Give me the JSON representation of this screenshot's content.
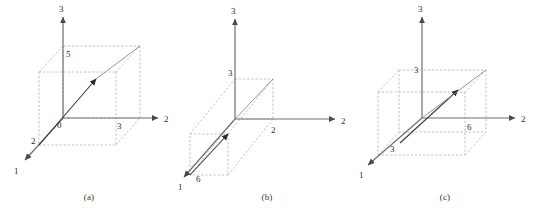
{
  "figure": {
    "background_color": "#ffffff",
    "axis_color": "#6e6e6e",
    "dashed_color": "#b9b9b9",
    "vector_color": "#4a4a4a",
    "label_color": "#2b2b2b",
    "panels": [
      {
        "caption": "(a)",
        "axes": [
          {
            "name": "axis-1",
            "tip_label": "1"
          },
          {
            "name": "axis-2",
            "tip_label": "2"
          },
          {
            "name": "axis-3",
            "tip_label": "3"
          }
        ],
        "origin_label": "0",
        "value_labels": [
          {
            "name": "axis-1-value",
            "text": "2"
          },
          {
            "name": "axis-2-value",
            "text": "3"
          },
          {
            "name": "axis-3-value",
            "text": "5"
          }
        ],
        "vector": {
          "x1": 2,
          "x2": 3,
          "x3": 5
        }
      },
      {
        "caption": "(b)",
        "axes": [
          {
            "name": "axis-1",
            "tip_label": "1"
          },
          {
            "name": "axis-2",
            "tip_label": "2"
          },
          {
            "name": "axis-3",
            "tip_label": "3"
          }
        ],
        "origin_label": "",
        "value_labels": [
          {
            "name": "axis-1-value",
            "text": "6"
          },
          {
            "name": "axis-2-value",
            "text": "2"
          },
          {
            "name": "axis-3-value",
            "text": "3"
          }
        ],
        "vector": {
          "x1": 6,
          "x2": 2,
          "x3": 3
        }
      },
      {
        "caption": "(c)",
        "axes": [
          {
            "name": "axis-1",
            "tip_label": "1"
          },
          {
            "name": "axis-2",
            "tip_label": "2"
          },
          {
            "name": "axis-3",
            "tip_label": "3"
          }
        ],
        "origin_label": "",
        "value_labels": [
          {
            "name": "axis-1-value",
            "text": "3"
          },
          {
            "name": "axis-2-value",
            "text": "6"
          },
          {
            "name": "axis-3-value",
            "text": "3"
          }
        ],
        "vector": {
          "x1": 3,
          "x2": 6,
          "x3": 3
        }
      }
    ]
  }
}
